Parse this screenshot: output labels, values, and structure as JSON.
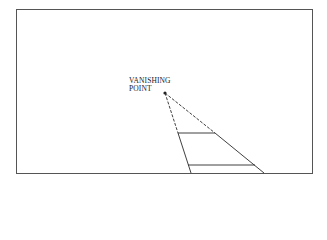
{
  "diagram": {
    "label_line1": "VANISHING",
    "label_line2": "POINT",
    "colors": {
      "line": "#2a2a2a",
      "background": "#ffffff"
    }
  }
}
